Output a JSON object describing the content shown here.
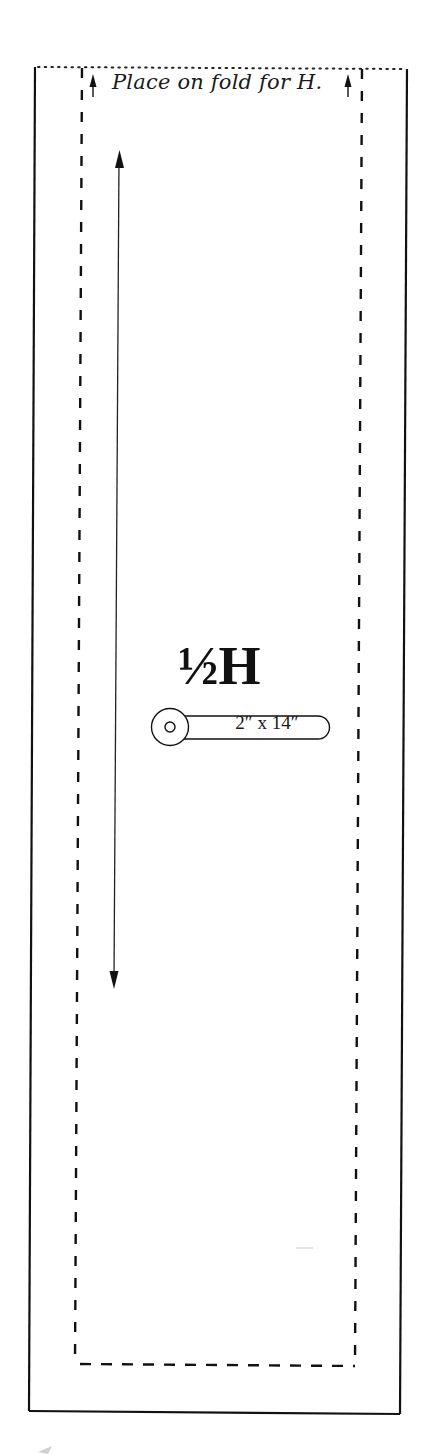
{
  "pattern_piece": {
    "fold_instruction": "Place on fold for H.",
    "piece_name": "½H",
    "cut_size": "2″ x 14″",
    "icons": {
      "fold_arrows": "arrow-up",
      "grainline": "double-arrow-vertical",
      "cut_marker": "circle-dot-pill"
    },
    "lines": {
      "outer_border": "solid",
      "fold_edge": "dotted",
      "seam_line": "dashed"
    },
    "colors": {
      "ink": "#111111",
      "paper": "#ffffff",
      "smudge": "#c8c8c8"
    }
  }
}
